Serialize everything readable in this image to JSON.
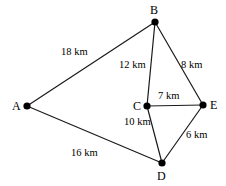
{
  "figure": {
    "type": "graph-diagram",
    "background_color": "#ffffff",
    "stroke_color": "#1a1a1a",
    "vertex_color": "#000000",
    "unit": "km"
  },
  "vertices": [
    {
      "id": "A",
      "label": "A",
      "x": 27,
      "y": 106,
      "label_x": 12,
      "label_y": 100
    },
    {
      "id": "B",
      "label": "B",
      "x": 155,
      "y": 22,
      "label_x": 150,
      "label_y": 4
    },
    {
      "id": "C",
      "label": "C",
      "x": 147,
      "y": 106,
      "label_x": 133,
      "label_y": 100
    },
    {
      "id": "D",
      "label": "D",
      "x": 162,
      "y": 163,
      "label_x": 157,
      "label_y": 170
    },
    {
      "id": "E",
      "label": "E",
      "x": 203,
      "y": 105,
      "label_x": 210,
      "label_y": 99
    }
  ],
  "edges": [
    {
      "id": "AB",
      "from": "A",
      "to": "B",
      "weight": 18,
      "label": "18 km",
      "label_x": 61,
      "label_y": 46
    },
    {
      "id": "BC",
      "from": "B",
      "to": "C",
      "weight": 12,
      "label": "12 km",
      "label_x": 119,
      "label_y": 59
    },
    {
      "id": "BE",
      "from": "B",
      "to": "E",
      "weight": 8,
      "label": "8 km",
      "label_x": 181,
      "label_y": 59
    },
    {
      "id": "CE",
      "from": "C",
      "to": "E",
      "weight": 7,
      "label": "7 km",
      "label_x": 158,
      "label_y": 90
    },
    {
      "id": "CD",
      "from": "C",
      "to": "D",
      "weight": 10,
      "label": "10 km",
      "label_x": 124,
      "label_y": 116
    },
    {
      "id": "DE",
      "from": "D",
      "to": "E",
      "weight": 6,
      "label": "6 km",
      "label_x": 186,
      "label_y": 129
    },
    {
      "id": "AD",
      "from": "A",
      "to": "D",
      "weight": 16,
      "label": "16 km",
      "label_x": 71,
      "label_y": 147
    }
  ]
}
